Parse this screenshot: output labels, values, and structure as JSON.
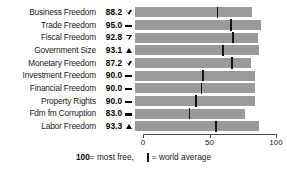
{
  "chart_data": {
    "type": "bar",
    "title": "",
    "xlabel": "",
    "ylabel": "",
    "xlim": [
      0,
      100
    ],
    "grid": false,
    "legend_position": "bottom",
    "categories": [
      "Business Freedom",
      "Trade Freedom",
      "Fiscal Freedom",
      "Government Size",
      "Monetary Freedom",
      "Investment Freedom",
      "Financial Freedom",
      "Property Rights",
      "Fdm fm Corruption",
      "Labor Freedom"
    ],
    "values": [
      88.2,
      95.0,
      92.8,
      93.1,
      87.2,
      90.0,
      90.0,
      90.0,
      83.0,
      93.3
    ],
    "series": [
      {
        "name": "Score",
        "values": [
          88.2,
          95.0,
          92.8,
          93.1,
          87.2,
          90.0,
          90.0,
          90.0,
          83.0,
          93.3
        ]
      },
      {
        "name": "World average",
        "values": [
          62,
          72,
          74,
          66,
          73,
          51,
          50,
          46,
          41,
          61
        ]
      }
    ],
    "change_markers": [
      "down-hollow",
      "dash",
      "down-hollow",
      "up-solid",
      "down-hollow",
      "dash",
      "dash",
      "dash",
      "dash",
      "up-solid"
    ],
    "tick_labels": [
      "0",
      "50",
      "100"
    ],
    "tick_values": [
      0,
      50,
      100
    ]
  },
  "rows": [
    {
      "label": "Business Freedom",
      "value": "88.2",
      "score": 88.2,
      "average": 62,
      "marker": "down-hollow"
    },
    {
      "label": "Trade Freedom",
      "value": "95.0",
      "score": 95.0,
      "average": 72,
      "marker": "dash"
    },
    {
      "label": "Fiscal Freedom",
      "value": "92.8",
      "score": 92.8,
      "average": 74,
      "marker": "down-hollow"
    },
    {
      "label": "Government Size",
      "value": "93.1",
      "score": 93.1,
      "average": 66,
      "marker": "up-solid"
    },
    {
      "label": "Monetary Freedom",
      "value": "87.2",
      "score": 87.2,
      "average": 73,
      "marker": "down-hollow"
    },
    {
      "label": "Investment Freedom",
      "value": "90.0",
      "score": 90.0,
      "average": 51,
      "marker": "dash"
    },
    {
      "label": "Financial Freedom",
      "value": "90.0",
      "score": 90.0,
      "average": 50,
      "marker": "dash"
    },
    {
      "label": "Property Rights",
      "value": "90.0",
      "score": 90.0,
      "average": 46,
      "marker": "dash"
    },
    {
      "label": "Fdm fm Corruption",
      "value": "83.0",
      "score": 83.0,
      "average": 41,
      "marker": "dash"
    },
    {
      "label": "Labor Freedom",
      "value": "93.3",
      "score": 93.3,
      "average": 61,
      "marker": "up-solid"
    }
  ],
  "axis": {
    "ticks": [
      {
        "label": "0",
        "value": 0
      },
      {
        "label": "50",
        "value": 50
      },
      {
        "label": "100",
        "value": 100
      }
    ]
  },
  "legend": {
    "most_free_value": "100",
    "most_free_text": " = most free,",
    "average_text": " = world average"
  },
  "colors": {
    "bar": "#9a9a9a",
    "average_tick": "#141414",
    "text": "#1a1a1a",
    "axis": "#4a4a4a",
    "background": "#ffffff"
  }
}
